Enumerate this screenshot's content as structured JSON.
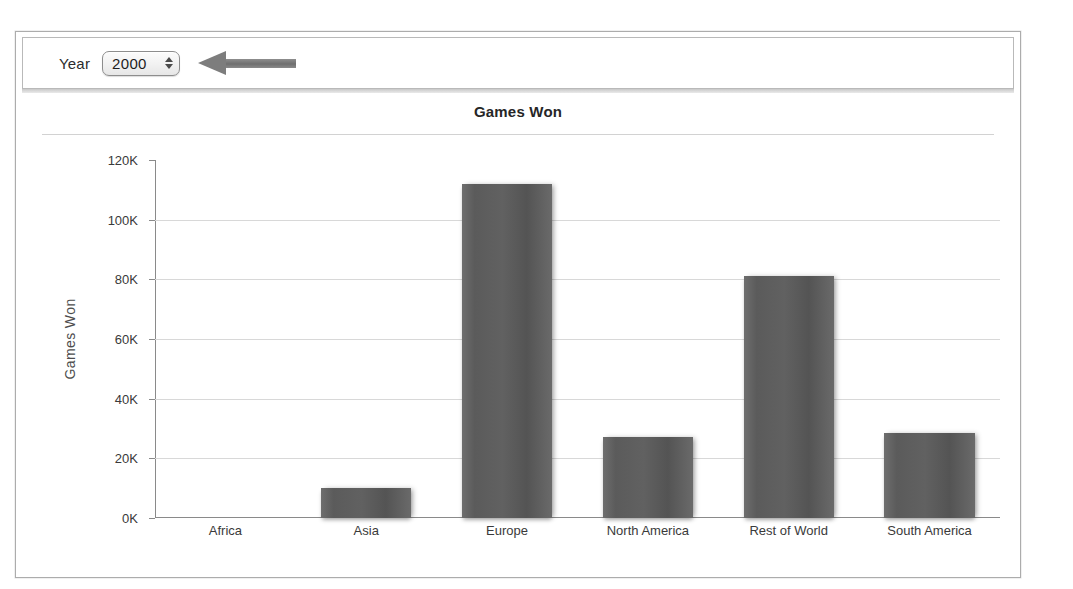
{
  "top_bleed": {
    "left_fragment": "",
    "right_fragment": ""
  },
  "toolbar": {
    "year_label": "Year",
    "year_value": "2000",
    "stepper_up_icon": "triangle-up-icon",
    "stepper_down_icon": "triangle-down-icon",
    "annotation_icon": "left-arrow-annotation"
  },
  "chart_data": {
    "type": "bar",
    "title": "Games Won",
    "xlabel": "",
    "ylabel": "Games Won",
    "categories": [
      "Africa",
      "Asia",
      "Europe",
      "North America",
      "Rest of World",
      "South America"
    ],
    "values": [
      0,
      10000,
      112000,
      27000,
      81000,
      28500
    ],
    "ylim": [
      0,
      120000
    ],
    "ytick_values": [
      0,
      20000,
      40000,
      60000,
      80000,
      100000,
      120000
    ],
    "ytick_labels": [
      "0K",
      "20K",
      "40K",
      "60K",
      "80K",
      "100K",
      "120K"
    ],
    "grid": true,
    "legend": false,
    "bar_color": "#5e5e5e"
  }
}
